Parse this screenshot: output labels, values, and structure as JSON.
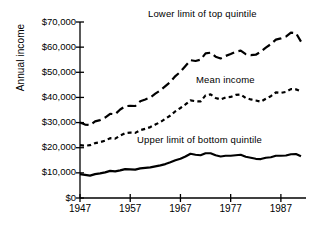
{
  "chart_data": {
    "type": "line",
    "title": "",
    "xlabel": "",
    "ylabel": "Annual income",
    "xlim": [
      1947,
      1992
    ],
    "ylim": [
      0,
      70000
    ],
    "grid": false,
    "legend_position": "inline-annotations",
    "y_ticks": [
      0,
      10000,
      20000,
      30000,
      40000,
      50000,
      60000,
      70000
    ],
    "y_tick_labels": [
      "$0",
      "$10,000",
      "$20,000",
      "$30,000",
      "$40,000",
      "$50,000",
      "$60,000",
      "$70,000"
    ],
    "x_ticks": [
      1947,
      1957,
      1967,
      1977,
      1987
    ],
    "x_tick_labels": [
      "1947",
      "1957",
      "1967",
      "1977",
      "1987"
    ],
    "x": [
      1947,
      1948,
      1949,
      1950,
      1951,
      1952,
      1953,
      1954,
      1955,
      1956,
      1957,
      1958,
      1959,
      1960,
      1961,
      1962,
      1963,
      1964,
      1965,
      1966,
      1967,
      1968,
      1969,
      1970,
      1971,
      1972,
      1973,
      1974,
      1975,
      1976,
      1977,
      1978,
      1979,
      1980,
      1981,
      1982,
      1983,
      1984,
      1985,
      1986,
      1987,
      1988,
      1989,
      1990,
      1991
    ],
    "series": [
      {
        "name": "Lower limit of top quintile",
        "style": "long-dash",
        "color": "#000000",
        "values": [
          30000,
          29200,
          29000,
          30500,
          31000,
          32000,
          33500,
          33300,
          35200,
          36500,
          36700,
          36600,
          38500,
          39200,
          40000,
          41500,
          42800,
          44500,
          46200,
          48500,
          50200,
          52500,
          54800,
          54500,
          55000,
          57500,
          57800,
          56200,
          55500,
          56500,
          57300,
          58200,
          58600,
          57200,
          56800,
          57000,
          58200,
          59800,
          61200,
          63000,
          63500,
          64200,
          65800,
          65600,
          62200
        ]
      },
      {
        "name": "Mean income",
        "style": "short-dash",
        "color": "#000000",
        "values": [
          21000,
          20800,
          21000,
          21800,
          22200,
          22800,
          23800,
          23600,
          24800,
          25800,
          26000,
          25900,
          27000,
          27500,
          28200,
          29200,
          30200,
          31500,
          32800,
          34500,
          35800,
          37200,
          38800,
          38500,
          38400,
          40800,
          41200,
          39800,
          39200,
          40000,
          40200,
          41000,
          41200,
          39800,
          39200,
          38800,
          38300,
          39500,
          40500,
          42000,
          41800,
          42200,
          43300,
          43200,
          42500
        ]
      },
      {
        "name": "Upper limit of bottom quintile",
        "style": "solid",
        "color": "#000000",
        "values": [
          9500,
          9200,
          8900,
          9500,
          9800,
          10200,
          10800,
          10600,
          11000,
          11500,
          11400,
          11300,
          11800,
          12000,
          12200,
          12600,
          13000,
          13500,
          14200,
          15000,
          15600,
          16500,
          17600,
          17200,
          17000,
          17800,
          17800,
          17000,
          16500,
          16800,
          16800,
          17000,
          17200,
          16400,
          16000,
          15600,
          15500,
          16000,
          16200,
          16800,
          16800,
          16900,
          17400,
          17500,
          16600
        ]
      }
    ],
    "annotations": [
      {
        "text": "Lower limit of top quintile",
        "series": "Lower limit of top quintile"
      },
      {
        "text": "Mean income",
        "series": "Mean income"
      },
      {
        "text": "Upper limit of bottom quintile",
        "series": "Upper limit of bottom quintile"
      }
    ]
  }
}
